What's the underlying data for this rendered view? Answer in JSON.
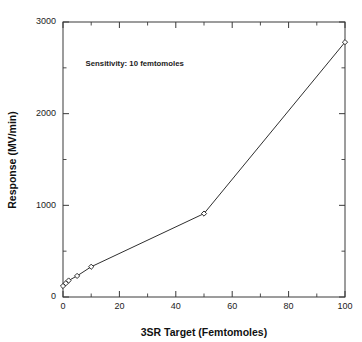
{
  "chart_data": {
    "type": "line",
    "title": "",
    "xlabel": "3SR Target (Femtomoles)",
    "ylabel": "Response (MV/min)",
    "xlim": [
      0,
      100
    ],
    "ylim": [
      0,
      3000
    ],
    "grid": false,
    "legend": false,
    "marker": "open-diamond",
    "line_color": "#2f2f2f",
    "x": [
      0,
      1,
      2,
      5,
      10,
      50,
      100
    ],
    "values": [
      120,
      150,
      180,
      230,
      330,
      910,
      2780
    ],
    "series": [
      {
        "name": "Response",
        "x": [
          0,
          1,
          2,
          5,
          10,
          50,
          100
        ],
        "values": [
          120,
          150,
          180,
          230,
          330,
          910,
          2780
        ]
      }
    ],
    "xticks": [
      0,
      20,
      40,
      60,
      80,
      100
    ],
    "xtick_labels": [
      "0",
      "20",
      "40",
      "60",
      "80",
      "100"
    ],
    "xminor_step": 10,
    "yticks": [
      0,
      1000,
      2000,
      3000
    ],
    "ytick_labels": [
      "0",
      "1000",
      "2000",
      "3000"
    ],
    "yminor_step": 500,
    "annotations": [
      {
        "text": "Sensitivity: 10 femtomoles",
        "x": 8,
        "y": 2520
      }
    ]
  },
  "figure": {
    "background": "#ffffff",
    "frame_color": "#3a3a3a"
  }
}
